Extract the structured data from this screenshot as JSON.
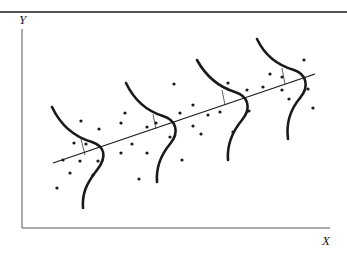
{
  "figure": {
    "axes": {
      "x_label": "X",
      "y_label": "Y"
    },
    "colors": {
      "ink": "#1a1a1a",
      "axis": "#555555",
      "background": "#ffffff"
    },
    "regression_line": {
      "x1": 53,
      "y1": 163,
      "x2": 315,
      "y2": 74
    },
    "curves": [
      {
        "name": "distribution-1",
        "path": "M52,107 C62,128 78,138 92,142 C104,146 108,156 97,170 C86,184 82,194 83,208",
        "tick": {
          "x1": 81,
          "y1": 139,
          "x2": 85,
          "y2": 155
        }
      },
      {
        "name": "distribution-2",
        "path": "M126,83 C136,104 150,112 163,116 C176,120 180,132 170,144 C160,156 156,168 157,182",
        "tick": {
          "x1": 153,
          "y1": 114,
          "x2": 156,
          "y2": 129
        }
      },
      {
        "name": "distribution-3",
        "path": "M197,60 C208,80 222,88 235,92 C248,96 252,108 242,120 C232,132 227,146 228,160",
        "tick": {
          "x1": 222,
          "y1": 90,
          "x2": 225,
          "y2": 105
        }
      },
      {
        "name": "distribution-4",
        "path": "M257,39 C266,58 280,66 294,70 C306,74 310,86 300,98 C290,110 286,124 288,139",
        "tick": {
          "x1": 282,
          "y1": 68,
          "x2": 285,
          "y2": 84
        }
      }
    ],
    "points": [
      [
        81,
        121
      ],
      [
        99,
        129
      ],
      [
        74,
        143
      ],
      [
        86,
        144
      ],
      [
        63,
        160
      ],
      [
        80,
        161
      ],
      [
        98,
        161
      ],
      [
        70,
        173
      ],
      [
        93,
        175
      ],
      [
        57,
        188
      ],
      [
        174,
        84
      ],
      [
        125,
        113
      ],
      [
        121,
        123
      ],
      [
        180,
        113
      ],
      [
        156,
        123
      ],
      [
        147,
        127
      ],
      [
        132,
        144
      ],
      [
        121,
        153
      ],
      [
        147,
        153
      ],
      [
        170,
        137
      ],
      [
        182,
        160
      ],
      [
        139,
        179
      ],
      [
        228,
        83
      ],
      [
        193,
        105
      ],
      [
        208,
        115
      ],
      [
        193,
        126
      ],
      [
        220,
        112
      ],
      [
        233,
        132
      ],
      [
        201,
        134
      ],
      [
        249,
        111
      ],
      [
        304,
        60
      ],
      [
        270,
        74
      ],
      [
        247,
        90
      ],
      [
        263,
        87
      ],
      [
        282,
        77
      ],
      [
        282,
        90
      ],
      [
        308,
        89
      ],
      [
        289,
        99
      ],
      [
        313,
        108
      ]
    ]
  }
}
